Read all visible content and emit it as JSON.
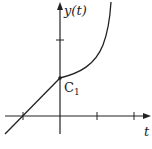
{
  "diagram": {
    "y_axis_label": "y(t)",
    "x_axis_label": "t",
    "point_label": "C",
    "point_subscript": "1",
    "colors": {
      "ink": "#222222",
      "background": "#ffffff"
    },
    "t_axis_ticks": 3,
    "y_axis_ticks": 1,
    "segments": [
      "linear segment for t < 0 through t-axis",
      "increasing convex curve for t > 0"
    ]
  }
}
